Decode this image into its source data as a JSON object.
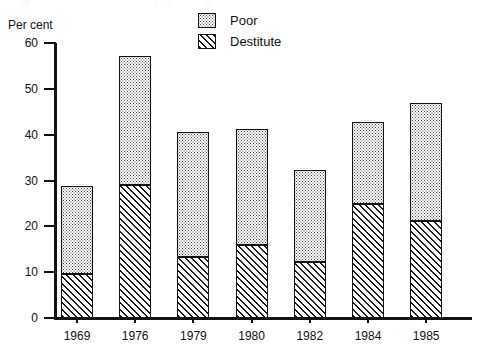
{
  "scan": {
    "top_artifact_fragments": [
      "░▒",
      "░ ░░",
      "░"
    ]
  },
  "legend": {
    "position": "top-center-right",
    "items": [
      {
        "label": "Poor",
        "pattern": "dotted-stipple",
        "swatch_name": "legend-swatch-poor"
      },
      {
        "label": "Destitute",
        "pattern": "diagonal-hatch",
        "swatch_name": "legend-swatch-destitute"
      }
    ]
  },
  "axes": {
    "y_title": "Per cent",
    "y_ticks": [
      "60",
      "50",
      "40",
      "30",
      "20",
      "10",
      "0"
    ],
    "x_ticks": [
      "1969",
      "1976",
      "1979",
      "1980",
      "1982",
      "1984",
      "1985"
    ]
  },
  "chart_data": {
    "type": "bar",
    "stacked": true,
    "title": "",
    "subtitle": "",
    "xlabel": "",
    "ylabel": "Per cent",
    "ylim": [
      0,
      60
    ],
    "ytick_step": 10,
    "grid": false,
    "legend_position": "top-right",
    "categories": [
      "1969",
      "1976",
      "1979",
      "1980",
      "1982",
      "1984",
      "1985"
    ],
    "series": [
      {
        "name": "Destitute",
        "pattern": "diagonal-hatch",
        "values": [
          9.6,
          29.0,
          13.3,
          16.0,
          12.3,
          24.8,
          21.2
        ]
      },
      {
        "name": "Poor",
        "pattern": "dotted-stipple",
        "values": [
          19.2,
          28.2,
          27.2,
          25.2,
          20.0,
          17.9,
          25.8
        ]
      }
    ],
    "totals": [
      28.8,
      57.2,
      40.5,
      41.2,
      32.3,
      42.7,
      47.0
    ],
    "annotations": []
  }
}
